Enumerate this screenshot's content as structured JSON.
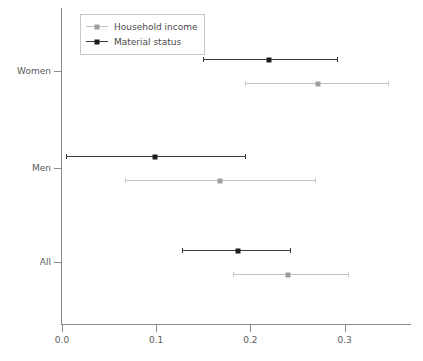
{
  "legend": {
    "position": "top-left",
    "entries": [
      {
        "label": "Household income",
        "style": "light",
        "color": "#c2c2c2",
        "marker_color": "#9e9e9e"
      },
      {
        "label": "Material status",
        "style": "dark",
        "color": "#3a3a3a",
        "marker_color": "#1c1c1c"
      }
    ]
  },
  "axis": {
    "x_ticklabels": [
      "0.0",
      "0.1",
      "0.2",
      "0.3"
    ],
    "y_ticklabels": [
      "Women",
      "Men",
      "All"
    ]
  },
  "chart_data": {
    "type": "scatter",
    "subtype": "forest-plot",
    "title": "",
    "xlabel": "",
    "ylabel": "",
    "xlim": [
      -0.005,
      0.37
    ],
    "xticks": [
      0.0,
      0.1,
      0.2,
      0.3
    ],
    "xticklabels": [
      "0.0",
      "0.1",
      "0.2",
      "0.3"
    ],
    "categories": [
      "Women",
      "Men",
      "All"
    ],
    "grid": false,
    "legend_position": "top-left",
    "series": [
      {
        "name": "Household income",
        "color": "#c2c2c2",
        "marker_color": "#9e9e9e",
        "points": [
          {
            "category": "Women",
            "estimate": 0.272,
            "ci_low": 0.194,
            "ci_high": 0.346
          },
          {
            "category": "Men",
            "estimate": 0.168,
            "ci_low": 0.067,
            "ci_high": 0.269
          },
          {
            "category": "All",
            "estimate": 0.24,
            "ci_low": 0.182,
            "ci_high": 0.304
          }
        ]
      },
      {
        "name": "Material status",
        "color": "#3a3a3a",
        "marker_color": "#1c1c1c",
        "points": [
          {
            "category": "Women",
            "estimate": 0.22,
            "ci_low": 0.15,
            "ci_high": 0.292
          },
          {
            "category": "Men",
            "estimate": 0.099,
            "ci_low": 0.004,
            "ci_high": 0.194
          },
          {
            "category": "All",
            "estimate": 0.187,
            "ci_low": 0.127,
            "ci_high": 0.242
          }
        ]
      }
    ]
  }
}
